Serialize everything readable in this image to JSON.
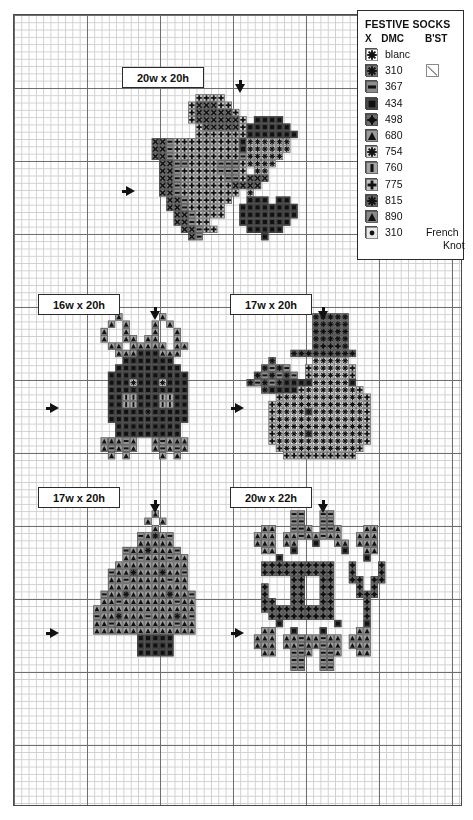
{
  "legend": {
    "title": "FESTIVE SOCKS",
    "headers": {
      "symbol": "X",
      "dmc": "DMC",
      "backstitch": "B'ST"
    },
    "rows": [
      {
        "symbol": "blanc-star-box",
        "dmc": "blanc",
        "bst": "",
        "fill": "#ffffff",
        "glyph": "starburst"
      },
      {
        "symbol": "310-star",
        "dmc": "310",
        "bst": "backstitch-box",
        "fill": "#7a7a7a",
        "glyph": "star"
      },
      {
        "symbol": "367-dash",
        "dmc": "367",
        "bst": "",
        "fill": "#8e8e8e",
        "glyph": "dash"
      },
      {
        "symbol": "434-square",
        "dmc": "434",
        "bst": "",
        "fill": "#4a4a4a",
        "glyph": "square"
      },
      {
        "symbol": "498-diamond",
        "dmc": "498",
        "bst": "",
        "fill": "#6d6d6d",
        "glyph": "diamond"
      },
      {
        "symbol": "680-triangle",
        "dmc": "680",
        "bst": "",
        "fill": "#9a9a9a",
        "glyph": "triangle"
      },
      {
        "symbol": "754-asterisk",
        "dmc": "754",
        "bst": "",
        "fill": "#d8d8d8",
        "glyph": "asterisk"
      },
      {
        "symbol": "760-bar",
        "dmc": "760",
        "bst": "",
        "fill": "#a5a5a5",
        "glyph": "bar"
      },
      {
        "symbol": "775-plus",
        "dmc": "775",
        "bst": "",
        "fill": "#c4c4c4",
        "glyph": "plus"
      },
      {
        "symbol": "815-starsmall",
        "dmc": "815",
        "bst": "",
        "fill": "#6a6a6a",
        "glyph": "starsmall"
      },
      {
        "symbol": "890-triangle-dark",
        "dmc": "890",
        "bst": "",
        "fill": "#8a8a8a",
        "glyph": "triangle"
      },
      {
        "symbol": "310-frenchknot",
        "dmc": "310",
        "bst": "",
        "fill": "#e8e8e8",
        "glyph": "dot",
        "note": "French",
        "note2": "Knot"
      }
    ]
  },
  "grid": {
    "cell_px": 7.3,
    "bold_every": 10,
    "left": 13,
    "top": 14,
    "width": 449,
    "height": 792,
    "line_color": "#cfcfcf",
    "bold_color": "#6e6e6e"
  },
  "sections": [
    {
      "id": "mitten",
      "label": "20w x 20h",
      "label_x": 122,
      "label_y": 67,
      "label_w": 82,
      "label_h": 21,
      "arrow_down_x": 235,
      "arrow_down_y": 84,
      "arrow_right_x": 126,
      "arrow_right_y": 186
    },
    {
      "id": "reindeer",
      "label": "16w x 20h",
      "label_x": 38,
      "label_y": 294,
      "label_w": 82,
      "label_h": 21,
      "arrow_down_x": 150,
      "arrow_down_y": 311,
      "arrow_right_x": 50,
      "arrow_right_y": 403
    },
    {
      "id": "snowman",
      "label": "17w x 20h",
      "label_x": 230,
      "label_y": 294,
      "label_w": 82,
      "label_h": 21,
      "arrow_down_x": 318,
      "arrow_down_y": 311,
      "arrow_right_x": 235,
      "arrow_right_y": 403
    },
    {
      "id": "tree",
      "label": "17w x 20h",
      "label_x": 38,
      "label_y": 487,
      "label_w": 82,
      "label_h": 21,
      "arrow_down_x": 150,
      "arrow_down_y": 504,
      "arrow_right_x": 50,
      "arrow_right_y": 628
    },
    {
      "id": "joy",
      "label": "20w x 22h",
      "label_x": 230,
      "label_y": 487,
      "label_w": 82,
      "label_h": 21,
      "arrow_down_x": 318,
      "arrow_down_y": 504,
      "arrow_right_x": 235,
      "arrow_right_y": 628
    }
  ],
  "palette": {
    "blanc": "#ffffff",
    "310": "#757575",
    "367": "#8e8e8e",
    "434": "#454545",
    "498": "#6d6d6d",
    "680": "#9e9e9e",
    "754": "#dcdcdc",
    "760": "#a8a8a8",
    "775": "#c6c6c6",
    "815": "#686868",
    "890": "#888888",
    "knot": "#e8e8e8"
  },
  "charts": [
    {
      "name": "mitten",
      "origin_col": 19,
      "origin_row": 11,
      "rows": [
        "....++++.......",
        "...+XXX++......",
        "...+XXXXX+.....",
        "...+XXXXXX+....",
        "....+XXXXX+....",
        "....++++++++...",
        "XX-+++++++++...",
        "XX-+++++++++...",
        "XX-+++++++++...",
        ".XX--++++---+..",
        ".XX-+++++---+..",
        ".XX-++++++--+..",
        ".XX-+++++++XX..",
        ".XX-+++++++XXX.",
        "..XX-+++++++...",
        "..XX-++++++....",
        "...XX-+++++....",
        "...XX-++++.....",
        "....XX-++......",
        ".....X-........"
      ],
      "overlay_blocks": [
        {
          "kind": "cuff-dark",
          "col": 30,
          "row": 14,
          "w": 5,
          "h": 2,
          "floss": "434"
        },
        {
          "kind": "cuff-light",
          "col": 29,
          "row": 16,
          "w": 7,
          "h": 3,
          "floss": "754"
        },
        {
          "kind": "heel",
          "col": 32,
          "row": 30,
          "w": 5,
          "h": 4,
          "floss": "434"
        }
      ]
    },
    {
      "name": "reindeer",
      "origin_col": 11,
      "origin_row": 41,
      "antlers": "triangles",
      "body_floss": "434",
      "hooves_floss": "680",
      "eye_color": "#ffffff"
    },
    {
      "name": "snowman",
      "origin_col": 32,
      "origin_row": 41,
      "hat_floss": "310",
      "body_floss": "blanc",
      "arm_floss": "434",
      "button_floss": "815"
    },
    {
      "name": "tree",
      "origin_col": 11,
      "origin_row": 68,
      "needle_floss": "680",
      "dark_floss": "890",
      "trunk_floss": "434",
      "ornament_floss": "367"
    },
    {
      "name": "joy",
      "origin_col": 32,
      "origin_row": 68,
      "letters": "JOY",
      "letter_floss": "498",
      "holly_floss": "680",
      "berry_floss": "434",
      "leaf_dark_floss": "367"
    }
  ]
}
